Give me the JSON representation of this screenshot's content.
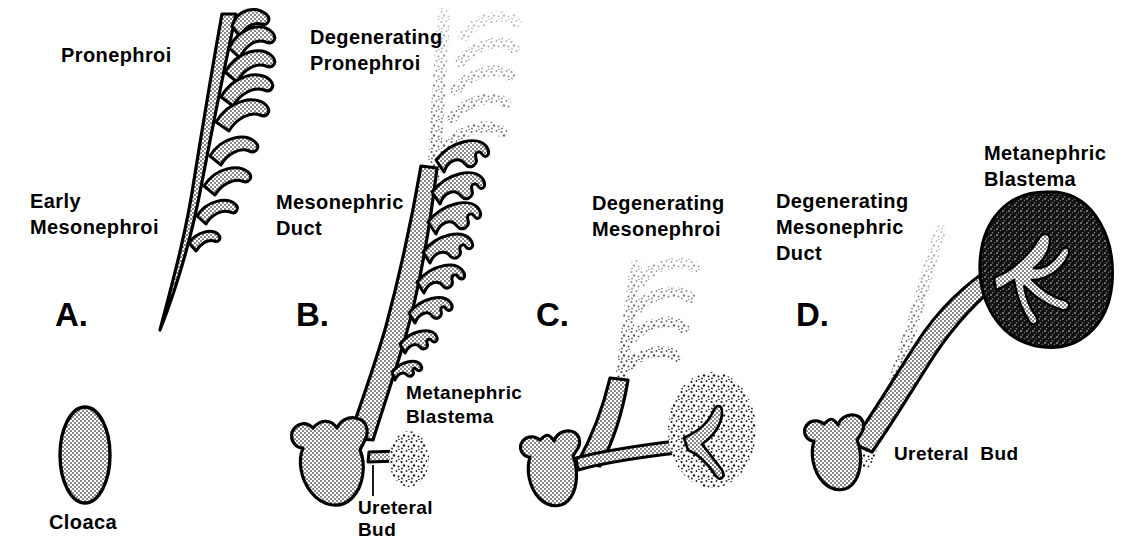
{
  "figure": {
    "background_color": "#ffffff",
    "ink_color": "#000000",
    "stipple_fill_color": "#d9d9d9",
    "dark_fill_color": "#1a1a1a",
    "width": 1137,
    "height": 541
  },
  "panels": [
    {
      "id": "A",
      "letter": "A.",
      "labels": [
        {
          "id": "pronephroi",
          "text": "Pronephroi"
        },
        {
          "id": "early-mesonephroi",
          "text": "Early\nMesonephroi"
        },
        {
          "id": "cloaca",
          "text": "Cloaca"
        }
      ]
    },
    {
      "id": "B",
      "letter": "B.",
      "labels": [
        {
          "id": "degenerating-pronephroi",
          "text": "Degenerating\nPronephroi"
        },
        {
          "id": "mesonephric-duct",
          "text": "Mesonephric\nDuct"
        },
        {
          "id": "metanephric-blastema",
          "text": "Metanephric\nBlastema"
        },
        {
          "id": "ureteral-bud",
          "text": "Ureteral\nBud"
        }
      ]
    },
    {
      "id": "C",
      "letter": "C.",
      "labels": [
        {
          "id": "degenerating-mesonephroi",
          "text": "Degenerating\nMesonephroi"
        }
      ]
    },
    {
      "id": "D",
      "letter": "D.",
      "labels": [
        {
          "id": "degenerating-mesonephric-duct",
          "text": "Degenerating\nMesonephric\nDuct"
        },
        {
          "id": "metanephric-blastema",
          "text": "Metanephric\nBlastema"
        },
        {
          "id": "ureteral-bud",
          "text": "Ureteral  Bud"
        }
      ]
    }
  ],
  "text": {
    "a_letter": "A.",
    "b_letter": "B.",
    "c_letter": "C.",
    "d_letter": "D.",
    "pronephroi": "Pronephroi",
    "early_line1": "Early",
    "early_line2": "Mesonephroi",
    "cloaca": "Cloaca",
    "deg_pron_line1": "Degenerating",
    "deg_pron_line2": "Pronephroi",
    "meso_duct_line1": "Mesonephric",
    "meso_duct_line2": "Duct",
    "meta_blast_b_line1": "Metanephric",
    "meta_blast_b_line2": "Blastema",
    "ureteral_b_line1": "Ureteral",
    "ureteral_b_line2": "Bud",
    "deg_meso_line1": "Degenerating",
    "deg_meso_line2": "Mesonephroi",
    "deg_md_line1": "Degenerating",
    "deg_md_line2": "Mesonephric",
    "deg_md_line3": "Duct",
    "meta_blast_d_line1": "Metanephric",
    "meta_blast_d_line2": "Blastema",
    "ureteral_d": "Ureteral  Bud"
  }
}
